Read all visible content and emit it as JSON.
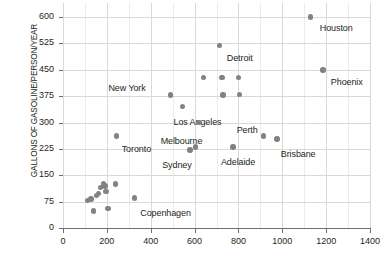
{
  "chart_data": {
    "type": "scatter",
    "title": "",
    "xlabel": "",
    "ylabel": "GALLONS OF GASOLINE/PERSON/YEAR",
    "xlim": [
      0,
      1400
    ],
    "ylim": [
      0,
      640
    ],
    "x_ticks": [
      0,
      200,
      400,
      600,
      800,
      1000,
      1200,
      1400
    ],
    "y_ticks": [
      0,
      75,
      150,
      225,
      300,
      375,
      450,
      525,
      600
    ],
    "grid": true,
    "grid_minor_x_step": 100,
    "legend": "none",
    "marker_color": "#808285",
    "points": [
      {
        "label": "Houston",
        "x": 1130,
        "y": 600,
        "label_dx": 9,
        "label_dy": 6
      },
      {
        "label": "Phoenix",
        "x": 1185,
        "y": 450,
        "label_dx": 8,
        "label_dy": 7
      },
      {
        "label": "Detroit",
        "x": 715,
        "y": 520,
        "label_dx": 7,
        "label_dy": 8
      },
      {
        "label": "New York",
        "x": 490,
        "y": 378,
        "label_dx": -62,
        "label_dy": -12
      },
      {
        "label": "Los Angeles",
        "x": 545,
        "y": 345,
        "label_dx": -9,
        "label_dy": 10
      },
      {
        "label": "Toronto",
        "x": 245,
        "y": 262,
        "label_dx": 5,
        "label_dy": 8
      },
      {
        "label": "Melbourne",
        "x": 605,
        "y": 230,
        "label_dx": -35,
        "label_dy": -11
      },
      {
        "label": "Sydney",
        "x": 580,
        "y": 222,
        "label_dx": -28,
        "label_dy": 10
      },
      {
        "label": "Perth",
        "x": 915,
        "y": 262,
        "label_dx": -27,
        "label_dy": -11
      },
      {
        "label": "Brisbane",
        "x": 975,
        "y": 253,
        "label_dx": 4,
        "label_dy": 10
      },
      {
        "label": "Adelaide",
        "x": 775,
        "y": 230,
        "label_dx": -12,
        "label_dy": 10
      },
      {
        "label": "Copenhagen",
        "x": 325,
        "y": 85,
        "label_dx": 6,
        "label_dy": 10
      },
      {
        "label": "",
        "x": 640,
        "y": 428,
        "label_dx": 0,
        "label_dy": 0
      },
      {
        "label": "",
        "x": 725,
        "y": 428,
        "label_dx": 0,
        "label_dy": 0
      },
      {
        "label": "",
        "x": 800,
        "y": 428,
        "label_dx": 0,
        "label_dy": 0
      },
      {
        "label": "",
        "x": 805,
        "y": 380,
        "label_dx": 0,
        "label_dy": 0
      },
      {
        "label": "",
        "x": 730,
        "y": 378,
        "label_dx": 0,
        "label_dy": 0
      },
      {
        "label": "",
        "x": 620,
        "y": 300,
        "label_dx": 0,
        "label_dy": 0
      },
      {
        "label": "",
        "x": 112,
        "y": 78,
        "label_dx": 0,
        "label_dy": 0
      },
      {
        "label": "",
        "x": 128,
        "y": 83,
        "label_dx": 0,
        "label_dy": 0
      },
      {
        "label": "",
        "x": 140,
        "y": 48,
        "label_dx": 0,
        "label_dy": 0
      },
      {
        "label": "",
        "x": 152,
        "y": 92,
        "label_dx": 0,
        "label_dy": 0
      },
      {
        "label": "",
        "x": 162,
        "y": 98,
        "label_dx": 0,
        "label_dy": 0
      },
      {
        "label": "",
        "x": 172,
        "y": 115,
        "label_dx": 0,
        "label_dy": 0
      },
      {
        "label": "",
        "x": 186,
        "y": 125,
        "label_dx": 0,
        "label_dy": 0
      },
      {
        "label": "",
        "x": 192,
        "y": 120,
        "label_dx": 0,
        "label_dy": 0
      },
      {
        "label": "",
        "x": 196,
        "y": 103,
        "label_dx": 0,
        "label_dy": 0
      },
      {
        "label": "",
        "x": 205,
        "y": 55,
        "label_dx": 0,
        "label_dy": 0
      },
      {
        "label": "",
        "x": 240,
        "y": 125,
        "label_dx": 0,
        "label_dy": 0
      }
    ]
  }
}
